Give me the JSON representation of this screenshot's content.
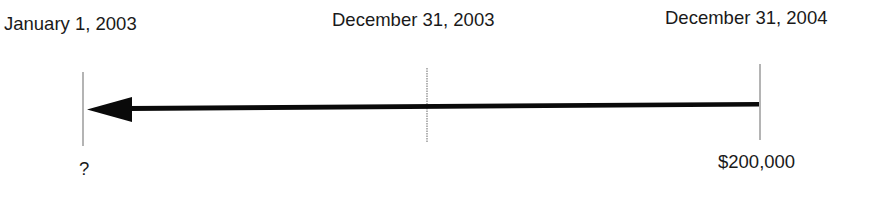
{
  "timeline": {
    "dates": [
      {
        "label": "January 1, 2003"
      },
      {
        "label": "December 31, 2003"
      },
      {
        "label": "December 31, 2004"
      }
    ],
    "values": [
      {
        "label": "?"
      },
      {
        "label": ""
      },
      {
        "label": "$200,000"
      }
    ],
    "arrow_direction": "left",
    "colors": {
      "line": "#0a0a0a",
      "tick": "#8c8c8c",
      "text": "#1a1a1a"
    }
  }
}
